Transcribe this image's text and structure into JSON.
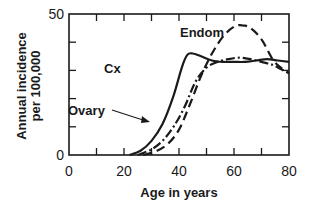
{
  "chart_data": {
    "type": "line",
    "title": "",
    "xlabel": "Age in years",
    "ylabel": "Annual incidence per 100,000",
    "ylabel_lines": [
      "Annual incidence",
      "per 100,000"
    ],
    "xlim": [
      0,
      80
    ],
    "ylim": [
      0,
      50
    ],
    "x_ticks": [
      0,
      20,
      40,
      60,
      80
    ],
    "x_minor_ticks": [
      10,
      30,
      50,
      70
    ],
    "y_ticks_labeled": [
      0,
      50
    ],
    "y_minor_ticks": [
      10,
      20,
      30,
      40
    ],
    "grid": false,
    "legend": "inline labels",
    "series": [
      {
        "name": "Cx",
        "style": "solid",
        "x": [
          22,
          26,
          30,
          34,
          38,
          41,
          43,
          45,
          48,
          52,
          56,
          60,
          64,
          68,
          72,
          76,
          80
        ],
        "values": [
          0,
          1.5,
          5,
          11,
          21,
          31,
          35.5,
          36,
          35,
          33.5,
          33,
          33,
          33,
          33.5,
          34,
          33.5,
          33
        ]
      },
      {
        "name": "Endom",
        "style": "dashed",
        "x": [
          27,
          32,
          36,
          40,
          44,
          48,
          52,
          56,
          60,
          63,
          66,
          70,
          74,
          77,
          80
        ],
        "values": [
          0,
          1.5,
          4,
          9,
          18,
          28,
          36,
          42,
          45.5,
          46,
          45,
          41,
          34,
          31,
          29
        ]
      },
      {
        "name": "Ovary",
        "style": "dash-dot",
        "x": [
          25,
          30,
          34,
          38,
          42,
          46,
          50,
          54,
          58,
          62,
          66,
          70,
          74,
          77,
          80
        ],
        "values": [
          0,
          2,
          5,
          10,
          17,
          26,
          31,
          33,
          34,
          34.5,
          34,
          33,
          32,
          30.5,
          29
        ]
      }
    ],
    "annotations": [
      {
        "text": "Endom",
        "points_to": "Endom"
      },
      {
        "text": "Cx",
        "points_to": "Cx"
      },
      {
        "text": "Ovary",
        "points_to": "Ovary",
        "arrow": true
      }
    ]
  }
}
